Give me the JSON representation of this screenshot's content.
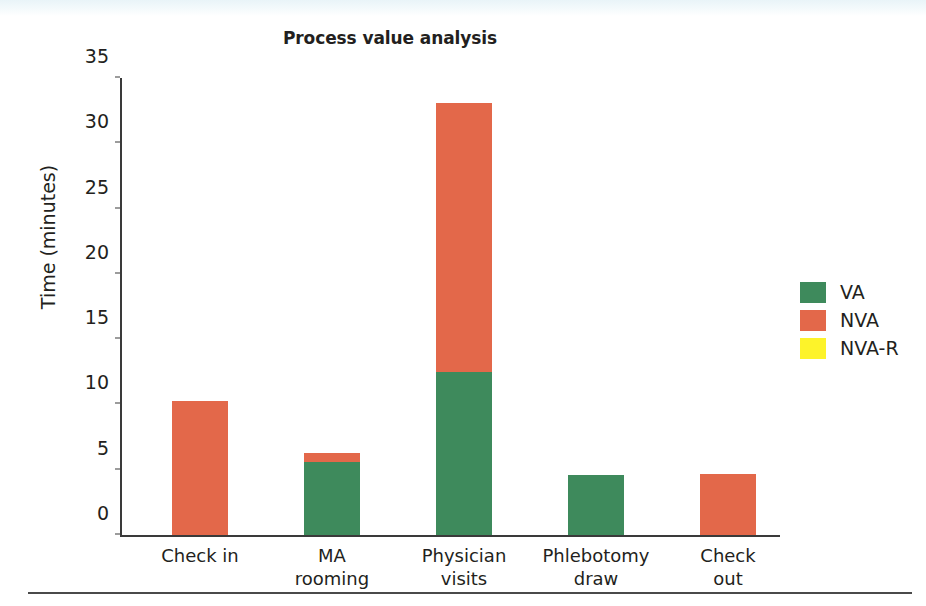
{
  "chart_data": {
    "type": "bar",
    "stacked": true,
    "title": "Process value analysis",
    "xlabel": "",
    "ylabel": "Time (minutes)",
    "ylim": [
      0,
      35
    ],
    "yticks": [
      0,
      5,
      10,
      15,
      20,
      25,
      30,
      35
    ],
    "grid": false,
    "legend_position": "right",
    "categories": [
      "Check in",
      "MA rooming",
      "Physician visits",
      "Phlebotomy draw",
      "Check out"
    ],
    "category_lines": [
      [
        "Check in"
      ],
      [
        "MA",
        "rooming"
      ],
      [
        "Physician",
        "visits"
      ],
      [
        "Phlebotomy",
        "draw"
      ],
      [
        "Check",
        "out"
      ]
    ],
    "series": [
      {
        "name": "VA",
        "color": "#3e8a5c",
        "values": [
          0,
          5.6,
          12.5,
          4.6,
          0
        ]
      },
      {
        "name": "NVA",
        "color": "#e3684a",
        "values": [
          10.3,
          0.7,
          20.6,
          0,
          4.7
        ]
      },
      {
        "name": "NVA-R",
        "color": "#fdf32a",
        "values": [
          0,
          0,
          0,
          0,
          0
        ]
      }
    ],
    "totals": [
      10.3,
      6.3,
      33.1,
      4.6,
      4.7
    ]
  },
  "legend": {
    "items": [
      {
        "label": "VA",
        "color": "#3e8a5c"
      },
      {
        "label": "NVA",
        "color": "#e3684a"
      },
      {
        "label": "NVA-R",
        "color": "#fdf32a"
      }
    ]
  }
}
